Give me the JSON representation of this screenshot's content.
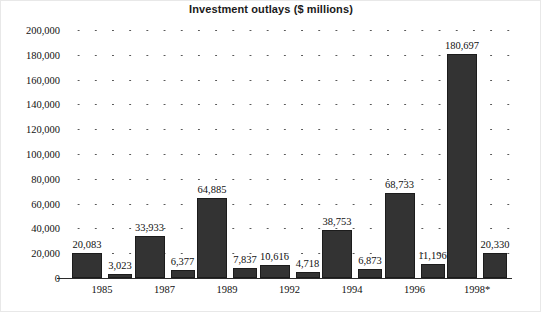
{
  "chart_data": {
    "type": "bar",
    "title": "Investment outlays ($ millions)",
    "xlabel": "",
    "ylabel": "",
    "ylim": [
      0,
      200000
    ],
    "ytick_labels": [
      "0",
      "20,000",
      "40,000",
      "60,000",
      "80,000",
      "100,000",
      "120,000",
      "140,000",
      "160,000",
      "180,000",
      "200,000"
    ],
    "ytick_values": [
      0,
      20000,
      40000,
      60000,
      80000,
      100000,
      120000,
      140000,
      160000,
      180000,
      200000
    ],
    "grid": true,
    "grid_style": "dotted-horizontal",
    "legend": "none",
    "categories": [
      "1985",
      "1987",
      "1989",
      "1992",
      "1994",
      "1996",
      "1998*"
    ],
    "bar_color": "#333333",
    "bars": [
      {
        "group": "1985",
        "value": 20083,
        "label": "20,083",
        "kind": "tall"
      },
      {
        "group": "1985",
        "value": 3023,
        "label": "3,023",
        "kind": "short"
      },
      {
        "group": "1987",
        "value": 33933,
        "label": "33,933",
        "kind": "tall"
      },
      {
        "group": "1987",
        "value": 6377,
        "label": "6,377",
        "kind": "short"
      },
      {
        "group": "1989",
        "value": 64885,
        "label": "64,885",
        "kind": "tall"
      },
      {
        "group": "1989",
        "value": 7837,
        "label": "7,837",
        "kind": "short"
      },
      {
        "group": "1992",
        "value": 10616,
        "label": "10,616",
        "kind": "tall"
      },
      {
        "group": "1992",
        "value": 4718,
        "label": "4,718",
        "kind": "short"
      },
      {
        "group": "1994",
        "value": 38753,
        "label": "38,753",
        "kind": "tall"
      },
      {
        "group": "1994",
        "value": 6873,
        "label": "6,873",
        "kind": "short"
      },
      {
        "group": "1996",
        "value": 68733,
        "label": "68,733",
        "kind": "tall"
      },
      {
        "group": "1996",
        "value": 11196,
        "label": "11,196",
        "kind": "short"
      },
      {
        "group": "1998*",
        "value": 180697,
        "label": "180,697",
        "kind": "tall"
      },
      {
        "group": "1998*",
        "value": 20330,
        "label": "20,330",
        "kind": "short"
      }
    ]
  }
}
